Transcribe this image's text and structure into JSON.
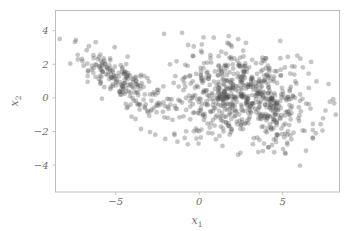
{
  "figure": {
    "background_color": "#ffffff",
    "width": 359,
    "height": 231
  },
  "chart_data": {
    "type": "scatter",
    "title": "",
    "xlabel": "x_1",
    "ylabel": "x_2",
    "xlabel_display": "x",
    "xlabel_sub": "1",
    "ylabel_display": "x",
    "ylabel_sub": "2",
    "xlim": [
      -8.6,
      8.4
    ],
    "ylim": [
      -5.6,
      5.2
    ],
    "xticks": [
      -5,
      0,
      5
    ],
    "xticklabels": [
      "−5",
      "0",
      "5"
    ],
    "yticks": [
      -4,
      -2,
      0,
      2,
      4
    ],
    "yticklabels": [
      "−4",
      "−2",
      "0",
      "2",
      "4"
    ],
    "grid": false,
    "legend": null,
    "marker": {
      "shape": "circle",
      "radius": 2.4,
      "color": "#4d4d4d",
      "opacity": 0.32,
      "edge": "none"
    },
    "axes_color": "#b8b8b8",
    "tick_label_color": "#6e6e6e",
    "n_points": 903,
    "clusters": [
      {
        "name": "left-cluster",
        "n": 203,
        "center": [
          -4.75,
          1.0
        ],
        "sigma": [
          1.35,
          0.95
        ],
        "correlation": -0.78
      },
      {
        "name": "right-cluster-a",
        "n": 360,
        "center": [
          1.3,
          0.25
        ],
        "sigma": [
          1.45,
          1.25
        ],
        "correlation": 0.15
      },
      {
        "name": "right-cluster-b",
        "n": 340,
        "center": [
          4.25,
          -0.25
        ],
        "sigma": [
          1.55,
          1.45
        ],
        "correlation": -0.1
      }
    ],
    "points": []
  }
}
